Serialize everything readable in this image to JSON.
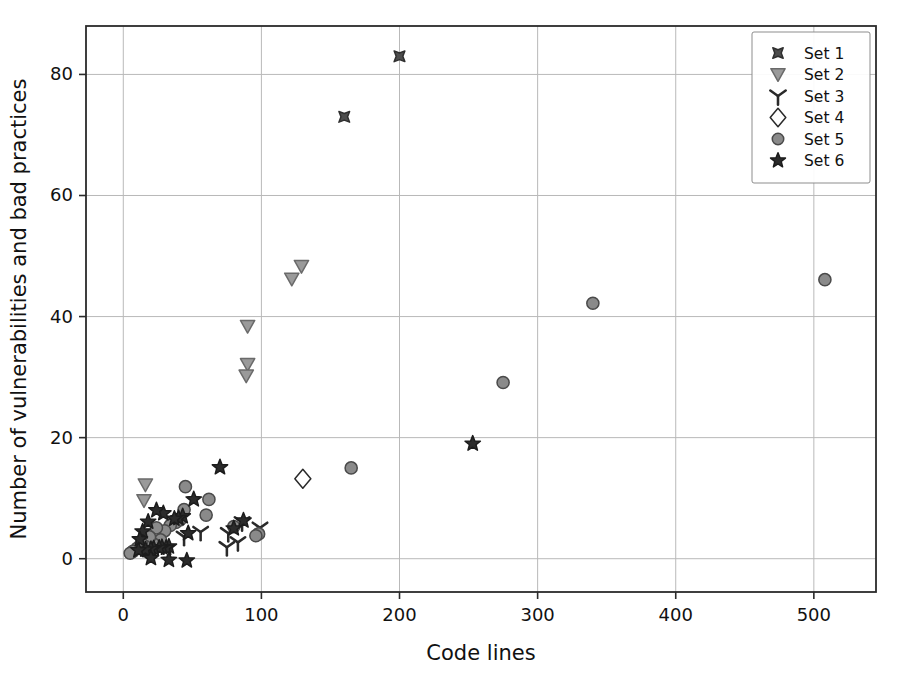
{
  "figure": {
    "background_color": "#ffffff",
    "frame_color": "#2b2b2b",
    "grid_color": "#b9b9b9"
  },
  "page_bleed_text": "the other hand the resulting code may contain subtle errors and the developer is required to review every suggestion carefully before accepting it into the project repository and the study shows that roughly one in three of the generated snippets introduces at least one weakness of the kinds catalogued by the community standard lists which means that automated scanning remains an essential part of the workflow for any team adopting these tools in production environments today",
  "chart_data": {
    "type": "scatter",
    "title": "",
    "xlabel": "Code lines",
    "ylabel": "Number of vulnerabilities and bad practices",
    "xlim": [
      -27,
      545
    ],
    "ylim": [
      -5.5,
      88
    ],
    "xticks": [
      0,
      100,
      200,
      300,
      400,
      500
    ],
    "yticks": [
      0,
      20,
      40,
      60,
      80
    ],
    "grid": true,
    "legend_position": "upper right",
    "series": [
      {
        "name": "Set 1",
        "marker": "x-asterisk",
        "color": "#4d4d4d",
        "edge_color": "#2f2f2f",
        "filled": true,
        "points": [
          [
            200,
            83
          ],
          [
            160,
            73
          ]
        ]
      },
      {
        "name": "Set 2",
        "marker": "triangle-down",
        "color": "#9a9a9a",
        "edge_color": "#6a6a6a",
        "filled": true,
        "points": [
          [
            129,
            48.3
          ],
          [
            122,
            46.2
          ],
          [
            90,
            38.4
          ],
          [
            90,
            32.1
          ],
          [
            89,
            30.2
          ],
          [
            16,
            12.2
          ],
          [
            15,
            9.6
          ]
        ]
      },
      {
        "name": "Set 3",
        "marker": "tri-down",
        "color": "#3a3a3a",
        "edge_color": "#2a2a2a",
        "filled": false,
        "points": [
          [
            99,
            5.1
          ],
          [
            86,
            6.0
          ],
          [
            83,
            2.7
          ],
          [
            76,
            4.2
          ],
          [
            75,
            1.9
          ],
          [
            56,
            4.4
          ],
          [
            44,
            3.6
          ]
        ]
      },
      {
        "name": "Set 4",
        "marker": "diamond-open",
        "color": "#ffffff",
        "edge_color": "#2a2a2a",
        "filled": false,
        "points": [
          [
            130,
            13.2
          ]
        ]
      },
      {
        "name": "Set 5",
        "marker": "circle",
        "color": "#8a8a8a",
        "edge_color": "#4a4a4a",
        "filled": true,
        "points": [
          [
            508,
            46.1
          ],
          [
            340,
            42.2
          ],
          [
            275,
            29.1
          ],
          [
            165,
            15.0
          ],
          [
            98,
            4.1
          ],
          [
            96,
            3.8
          ],
          [
            80,
            5.3
          ],
          [
            62,
            9.8
          ],
          [
            60,
            7.2
          ],
          [
            45,
            11.9
          ],
          [
            44,
            8.1
          ],
          [
            41,
            6.4
          ],
          [
            38,
            6.0
          ],
          [
            34,
            5.5
          ],
          [
            30,
            4.6
          ],
          [
            27,
            3.1
          ],
          [
            24,
            5.1
          ],
          [
            22,
            2.4
          ],
          [
            19,
            3.6
          ],
          [
            16,
            2.0
          ],
          [
            13,
            2.6
          ],
          [
            10,
            1.7
          ],
          [
            7,
            1.2
          ],
          [
            5,
            0.9
          ]
        ]
      },
      {
        "name": "Set 6",
        "marker": "star",
        "color": "#2b2b2b",
        "edge_color": "#1c1c1c",
        "filled": true,
        "points": [
          [
            253,
            19.0
          ],
          [
            70,
            15.1
          ],
          [
            87,
            6.3
          ],
          [
            80,
            5.0
          ],
          [
            51,
            9.8
          ],
          [
            47,
            4.2
          ],
          [
            43,
            7.0
          ],
          [
            40,
            6.7
          ],
          [
            37,
            6.6
          ],
          [
            33,
            2.0
          ],
          [
            31,
            1.8
          ],
          [
            29,
            7.5
          ],
          [
            28,
            1.9
          ],
          [
            26,
            1.8
          ],
          [
            24,
            8.0
          ],
          [
            22,
            1.7
          ],
          [
            20,
            1.6
          ],
          [
            18,
            6.1
          ],
          [
            16,
            1.5
          ],
          [
            14,
            4.5
          ],
          [
            12,
            3.2
          ],
          [
            11,
            1.4
          ],
          [
            33,
            -0.2
          ],
          [
            46,
            -0.3
          ],
          [
            20,
            0.1
          ]
        ]
      }
    ]
  }
}
